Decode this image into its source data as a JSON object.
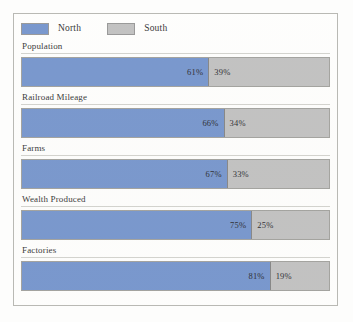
{
  "chart_data": {
    "type": "bar",
    "subtype": "horizontal-stacked-100",
    "title": "",
    "xlabel": "",
    "ylabel": "",
    "xlim": [
      0,
      100
    ],
    "grid": false,
    "legend_position": "top-left",
    "categories": [
      "Population",
      "Railroad Mileage",
      "Farms",
      "Wealth Produced",
      "Factories"
    ],
    "series": [
      {
        "name": "North",
        "color": "#6b8dc9",
        "values": [
          61,
          66,
          67,
          75,
          81
        ],
        "labels": [
          "61%",
          "66%",
          "67%",
          "75%",
          "81%"
        ]
      },
      {
        "name": "South",
        "color": "#bcbcbc",
        "values": [
          39,
          34,
          33,
          25,
          19
        ],
        "labels": [
          "39%",
          "34%",
          "33%",
          "25%",
          "19%"
        ]
      }
    ]
  },
  "legend": {
    "items": [
      {
        "label": "North",
        "color": "#6b8dc9"
      },
      {
        "label": "South",
        "color": "#bcbcbc"
      }
    ]
  },
  "rows": [
    {
      "label": "Population",
      "north_label": "61%",
      "south_label": "39%",
      "north": 61,
      "south": 39
    },
    {
      "label": "Railroad Mileage",
      "north_label": "66%",
      "south_label": "34%",
      "north": 66,
      "south": 34
    },
    {
      "label": "Farms",
      "north_label": "67%",
      "south_label": "33%",
      "north": 67,
      "south": 33
    },
    {
      "label": "Wealth Produced",
      "north_label": "75%",
      "south_label": "25%",
      "north": 75,
      "south": 25
    },
    {
      "label": "Factories",
      "north_label": "81%",
      "south_label": "19%",
      "north": 81,
      "south": 19
    }
  ],
  "colors": {
    "north": "#6b8dc9",
    "south": "#bcbcbc",
    "frame_border": "#b9b9b4",
    "background": "#fefefd",
    "text": "#1d1d1d"
  }
}
